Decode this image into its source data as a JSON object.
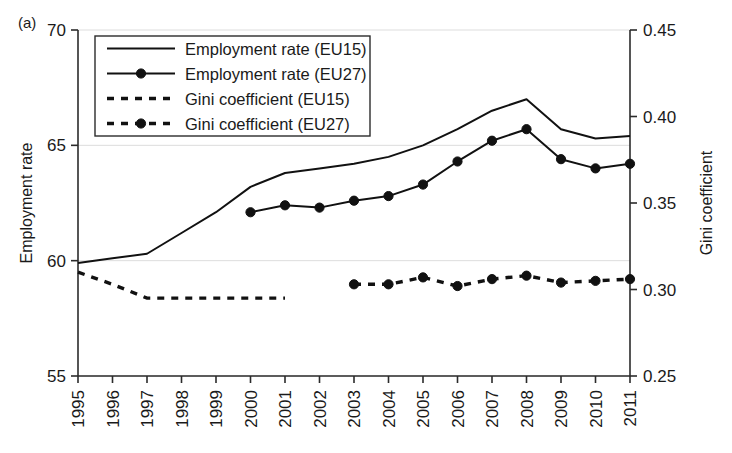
{
  "figure": {
    "panel_label": "(a)"
  },
  "chart_data": {
    "type": "line",
    "title": "",
    "xlabel": "",
    "ylabel": "Employment rate",
    "y2label": "Gini coefficient",
    "x": [
      1995,
      1996,
      1997,
      1998,
      1999,
      2000,
      2001,
      2002,
      2003,
      2004,
      2005,
      2006,
      2007,
      2008,
      2009,
      2010,
      2011
    ],
    "xtick_labels": [
      "1995",
      "1996",
      "1997",
      "1998",
      "1999",
      "2000",
      "2001",
      "2002",
      "2003",
      "2004",
      "2005",
      "2006",
      "2007",
      "2008",
      "2009",
      "2010",
      "2011"
    ],
    "ylim": [
      55,
      70
    ],
    "ytick_values": [
      55,
      60,
      65,
      70
    ],
    "ytick_labels": [
      "55",
      "60",
      "65",
      "70"
    ],
    "y2lim": [
      0.25,
      0.45
    ],
    "y2tick_values": [
      0.25,
      0.3,
      0.35,
      0.4,
      0.45
    ],
    "y2tick_labels": [
      "0.25",
      "0.30",
      "0.35",
      "0.40",
      "0.45"
    ],
    "grid": "horizontal",
    "legend_position": "top-left-inside",
    "series": [
      {
        "name": "Employment rate (EU15)",
        "axis": "left",
        "style": "solid",
        "marker": "none",
        "x": [
          1995,
          1996,
          1997,
          1998,
          1999,
          2000,
          2001,
          2002,
          2003,
          2004,
          2005,
          2006,
          2007,
          2008,
          2009,
          2010,
          2011
        ],
        "values": [
          59.9,
          60.1,
          60.3,
          61.2,
          62.1,
          63.2,
          63.8,
          64.0,
          64.2,
          64.5,
          65.0,
          65.7,
          66.5,
          67.0,
          65.7,
          65.3,
          65.4
        ]
      },
      {
        "name": "Employment rate (EU27)",
        "axis": "left",
        "style": "solid",
        "marker": "circle",
        "x": [
          2000,
          2001,
          2002,
          2003,
          2004,
          2005,
          2006,
          2007,
          2008,
          2009,
          2010,
          2011
        ],
        "values": [
          62.1,
          62.4,
          62.3,
          62.6,
          62.8,
          63.3,
          64.3,
          65.2,
          65.7,
          64.4,
          64.0,
          64.2
        ]
      },
      {
        "name": "Gini coefficient (EU15)",
        "axis": "right",
        "style": "dashed",
        "marker": "none",
        "x": [
          1995,
          1996,
          1997,
          1998,
          1999,
          2000,
          2001
        ],
        "values": [
          0.31,
          0.303,
          0.295,
          0.295,
          0.295,
          0.295,
          0.295
        ]
      },
      {
        "name": "Gini coefficient (EU27)",
        "axis": "right",
        "style": "dashed",
        "marker": "circle",
        "x": [
          2003,
          2004,
          2005,
          2006,
          2007,
          2008,
          2009,
          2010,
          2011
        ],
        "values": [
          0.303,
          0.303,
          0.307,
          0.302,
          0.306,
          0.308,
          0.304,
          0.305,
          0.306
        ]
      }
    ]
  }
}
